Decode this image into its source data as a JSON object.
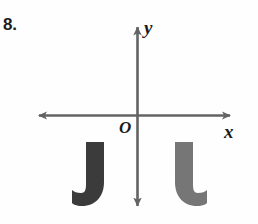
{
  "figure": {
    "problem_number": "8.",
    "background_color": "#fefefe"
  },
  "axes": {
    "color": "#636363",
    "origin_label": "O",
    "y_axis_label": "y",
    "x_axis_label": "x",
    "origin_px": {
      "x": 137,
      "y": 115
    },
    "x_axis_extent_px": {
      "left": 33,
      "right": 236
    },
    "y_axis_extent_px": {
      "top": 21,
      "bottom": 212
    },
    "arrowheads": [
      "left",
      "right",
      "up",
      "down"
    ]
  },
  "shapes": [
    {
      "name": "j-shape-left",
      "letter": "J",
      "color": "#3b3b3b",
      "quadrant": "III",
      "hook_direction": "left",
      "bounds_px": {
        "x": 72,
        "y": 142,
        "width": 34,
        "height": 64
      }
    },
    {
      "name": "l-shape-right",
      "letter": "L",
      "color": "#767676",
      "quadrant": "IV",
      "hook_direction": "right",
      "bounds_px": {
        "x": 175,
        "y": 142,
        "width": 34,
        "height": 64
      }
    }
  ]
}
